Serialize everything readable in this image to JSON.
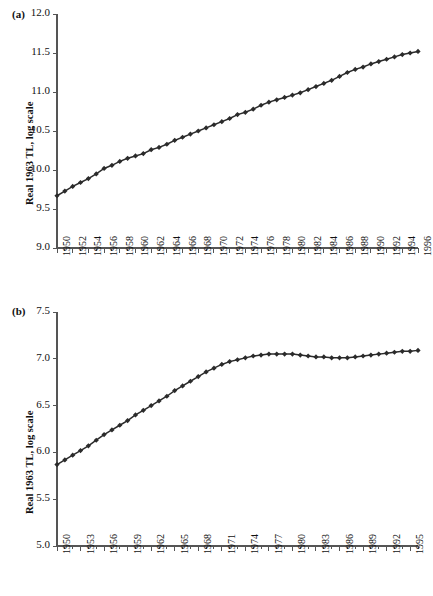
{
  "figure": {
    "background": "#ffffff",
    "series_color": "#2b2b2b",
    "axis_color": "#555555"
  },
  "panels": [
    {
      "tag": "(a)",
      "ylabel": "Real 1963 TL, log scale"
    },
    {
      "tag": "(b)",
      "ylabel": "Real 1963 TL, log scale"
    }
  ],
  "chart_data": [
    {
      "type": "line",
      "panel": "(a)",
      "title": "",
      "xlabel": "",
      "ylabel": "Real 1963 TL, log scale",
      "ylim": [
        9.0,
        12.0
      ],
      "yticks": [
        9.0,
        9.5,
        10.0,
        10.5,
        11.0,
        11.5,
        12.0
      ],
      "ytick_labels": [
        "9.0",
        "9.5",
        "10.0",
        "10.5",
        "11.0",
        "11.5",
        "12.0"
      ],
      "xlim": [
        1950,
        1996
      ],
      "xticks": [
        1950,
        1952,
        1954,
        1956,
        1958,
        1960,
        1962,
        1964,
        1966,
        1968,
        1970,
        1972,
        1974,
        1976,
        1978,
        1980,
        1982,
        1984,
        1986,
        1988,
        1990,
        1992,
        1994,
        1996
      ],
      "xtick_labels": [
        "1950",
        "1952",
        "1954",
        "1956",
        "1958",
        "1960",
        "1962",
        "1964",
        "1966",
        "1968",
        "1970",
        "1972",
        "1974",
        "1976",
        "1978",
        "1980",
        "1982",
        "1984",
        "1986",
        "1988",
        "1990",
        "1992",
        "1994",
        "1996"
      ],
      "minor_xticks_every": 1,
      "grid": false,
      "legend": null,
      "marker": "diamond",
      "x": [
        1950,
        1951,
        1952,
        1953,
        1954,
        1955,
        1956,
        1957,
        1958,
        1959,
        1960,
        1961,
        1962,
        1963,
        1964,
        1965,
        1966,
        1967,
        1968,
        1969,
        1970,
        1971,
        1972,
        1973,
        1974,
        1975,
        1976,
        1977,
        1978,
        1979,
        1980,
        1981,
        1982,
        1983,
        1984,
        1985,
        1986,
        1987,
        1988,
        1989,
        1990,
        1991,
        1992,
        1993,
        1994,
        1995,
        1996
      ],
      "values": [
        9.67,
        9.73,
        9.79,
        9.84,
        9.89,
        9.95,
        10.02,
        10.06,
        10.11,
        10.15,
        10.18,
        10.21,
        10.26,
        10.29,
        10.33,
        10.38,
        10.42,
        10.46,
        10.5,
        10.54,
        10.58,
        10.62,
        10.66,
        10.71,
        10.74,
        10.78,
        10.83,
        10.87,
        10.9,
        10.93,
        10.96,
        10.99,
        11.03,
        11.07,
        11.11,
        11.15,
        11.2,
        11.25,
        11.29,
        11.32,
        11.36,
        11.39,
        11.42,
        11.45,
        11.48,
        11.5,
        11.52
      ]
    },
    {
      "type": "line",
      "panel": "(b)",
      "title": "",
      "xlabel": "",
      "ylabel": "Real 1963 TL, log scale",
      "ylim": [
        5.0,
        7.5
      ],
      "yticks": [
        5.0,
        5.5,
        6.0,
        6.5,
        7.0,
        7.5
      ],
      "ytick_labels": [
        "5.0",
        "5.5",
        "6.0",
        "6.5",
        "7.0",
        "7.5"
      ],
      "xlim": [
        1950,
        1996
      ],
      "xticks": [
        1950,
        1953,
        1956,
        1959,
        1962,
        1965,
        1968,
        1971,
        1974,
        1977,
        1980,
        1983,
        1986,
        1989,
        1992,
        1995
      ],
      "xtick_labels": [
        "1950",
        "1953",
        "1956",
        "1959",
        "1962",
        "1965",
        "1968",
        "1971",
        "1974",
        "1977",
        "1980",
        "1983",
        "1986",
        "1989",
        "1992",
        "1995"
      ],
      "minor_xticks_every": 1,
      "grid": false,
      "legend": null,
      "marker": "diamond",
      "x": [
        1950,
        1951,
        1952,
        1953,
        1954,
        1955,
        1956,
        1957,
        1958,
        1959,
        1960,
        1961,
        1962,
        1963,
        1964,
        1965,
        1966,
        1967,
        1968,
        1969,
        1970,
        1971,
        1972,
        1973,
        1974,
        1975,
        1976,
        1977,
        1978,
        1979,
        1980,
        1981,
        1982,
        1983,
        1984,
        1985,
        1986,
        1987,
        1988,
        1989,
        1990,
        1991,
        1992,
        1993,
        1994,
        1995,
        1996
      ],
      "values": [
        5.87,
        5.92,
        5.97,
        6.02,
        6.07,
        6.13,
        6.19,
        6.24,
        6.29,
        6.34,
        6.4,
        6.45,
        6.5,
        6.55,
        6.6,
        6.66,
        6.71,
        6.76,
        6.81,
        6.86,
        6.9,
        6.94,
        6.97,
        6.99,
        7.01,
        7.03,
        7.04,
        7.05,
        7.05,
        7.05,
        7.05,
        7.04,
        7.03,
        7.02,
        7.02,
        7.01,
        7.01,
        7.01,
        7.02,
        7.03,
        7.04,
        7.05,
        7.06,
        7.07,
        7.08,
        7.08,
        7.09
      ]
    }
  ]
}
